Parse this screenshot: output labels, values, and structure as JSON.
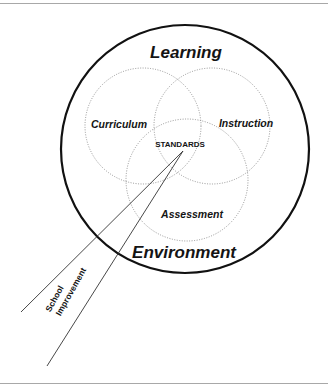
{
  "diagram": {
    "outer_circle": {
      "label_top": "Learning",
      "label_bottom": "Environment"
    },
    "circles": [
      {
        "name": "curriculum",
        "label": "Curriculum"
      },
      {
        "name": "instruction",
        "label": "Instruction"
      },
      {
        "name": "assessment",
        "label": "Assessment"
      }
    ],
    "center_label": "STANDARDS",
    "beam_label_line1": "School",
    "beam_label_line2": "Improvement",
    "colors": {
      "outer_stroke": "#111111",
      "inner_stroke": "#8a8a8a",
      "text": "#141414",
      "rule": "#a8a8a8",
      "background": "#ffffff"
    }
  }
}
